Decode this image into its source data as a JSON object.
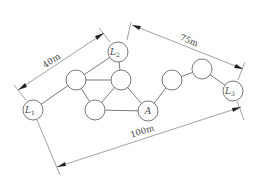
{
  "diagram": {
    "nodes": [
      {
        "id": "L1",
        "label": "L",
        "sub": "1",
        "x": 33,
        "y": 110
      },
      {
        "id": "L2",
        "label": "L",
        "sub": "2",
        "x": 118,
        "y": 52
      },
      {
        "id": "n1",
        "label": "",
        "x": 76,
        "y": 80
      },
      {
        "id": "n2",
        "label": "",
        "x": 121,
        "y": 80
      },
      {
        "id": "n3",
        "label": "",
        "x": 95,
        "y": 110
      },
      {
        "id": "A",
        "label": "A",
        "x": 148,
        "y": 111
      },
      {
        "id": "n4",
        "label": "",
        "x": 172,
        "y": 80
      },
      {
        "id": "n5",
        "label": "",
        "x": 202,
        "y": 69
      },
      {
        "id": "L3",
        "label": "L",
        "sub": "3",
        "x": 233,
        "y": 91
      }
    ],
    "edges": [
      [
        "L1",
        "n1"
      ],
      [
        "n1",
        "L2"
      ],
      [
        "n1",
        "n2"
      ],
      [
        "L2",
        "n2"
      ],
      [
        "n1",
        "n3"
      ],
      [
        "n2",
        "n3"
      ],
      [
        "n3",
        "A"
      ],
      [
        "n2",
        "A"
      ],
      [
        "A",
        "n4"
      ],
      [
        "n4",
        "n5"
      ],
      [
        "n5",
        "L3"
      ]
    ],
    "dimensions": [
      {
        "id": "d40",
        "label": "40m",
        "from": "L1",
        "to": "L2"
      },
      {
        "id": "d75",
        "label": "75m",
        "from": "L2",
        "to": "L3"
      },
      {
        "id": "d100",
        "label": "100m",
        "from": "L1",
        "to": "L3"
      }
    ]
  }
}
